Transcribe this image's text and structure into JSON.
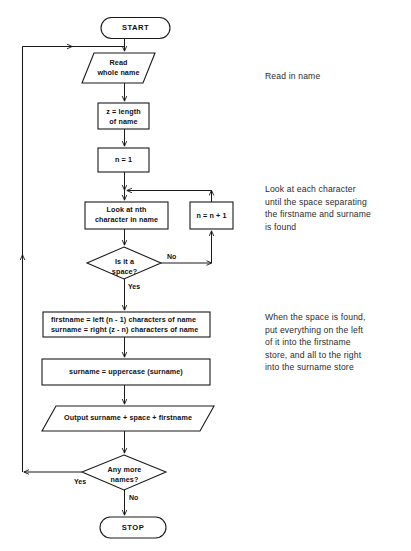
{
  "diagram": {
    "stroke_color": "#1a1a1a",
    "fill_color": "#ffffff",
    "nodes": [
      {
        "id": "start",
        "shape": "terminator",
        "label": "START"
      },
      {
        "id": "read",
        "shape": "parallelogram",
        "label": "Read\nwhole name"
      },
      {
        "id": "length",
        "shape": "process",
        "label": "z  = length\nof name"
      },
      {
        "id": "init_n",
        "shape": "process",
        "label": "n = 1"
      },
      {
        "id": "look_char",
        "shape": "process",
        "label": "Look at nth\ncharacter in name"
      },
      {
        "id": "increment",
        "shape": "process",
        "label": "n = n + 1"
      },
      {
        "id": "is_space",
        "shape": "decision",
        "label": "Is it  a\nspace?"
      },
      {
        "id": "split",
        "shape": "process",
        "label": "firstname = left (n - 1) characters of name\nsurname = right (z - n) characters of name"
      },
      {
        "id": "uppercase",
        "shape": "process",
        "label": "surname = uppercase (surname)"
      },
      {
        "id": "output",
        "shape": "parallelogram",
        "label": "Output surname + space + firstname"
      },
      {
        "id": "any_more",
        "shape": "decision",
        "label": "Any more\nnames?"
      },
      {
        "id": "stop",
        "shape": "terminator",
        "label": "STOP"
      }
    ],
    "edge_labels": [
      {
        "id": "space_no",
        "label": "No"
      },
      {
        "id": "space_yes",
        "label": "Yes"
      },
      {
        "id": "more_yes",
        "label": "Yes"
      },
      {
        "id": "more_no",
        "label": "No"
      }
    ],
    "annotations": [
      {
        "id": "note_read",
        "text": "Read in name"
      },
      {
        "id": "note_loop",
        "text": "Look at each character\nuntil the space separating\nthe firstname and surname\nis found"
      },
      {
        "id": "note_split",
        "text": "When the space is found,\nput everything on the left\nof it into the firstname\nstore, and all to the right\ninto the surname store"
      }
    ]
  }
}
